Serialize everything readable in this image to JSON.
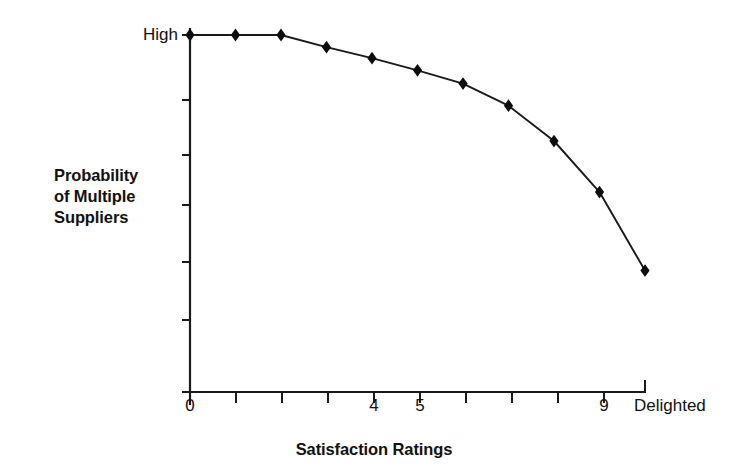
{
  "figure": {
    "background_color": "#ffffff",
    "ink_color": "#000000"
  },
  "axis": {
    "y_top_label": "High",
    "x_title": "Satisfaction Ratings",
    "y_title_line1": "Probability",
    "y_title_line2": "of Multiple",
    "y_title_line3": "Suppliers",
    "x_labels": [
      {
        "x": 0,
        "text": "0"
      },
      {
        "x": 4,
        "text": "4"
      },
      {
        "x": 5,
        "text": "5"
      },
      {
        "x": 9,
        "text": "9"
      },
      {
        "x": 10,
        "text": "Delighted"
      }
    ]
  },
  "chart_data": {
    "type": "line",
    "title": "",
    "xlabel": "Satisfaction Ratings",
    "ylabel": "Probability of Multiple Suppliers",
    "x": [
      0,
      1,
      2,
      3,
      4,
      5,
      6,
      7,
      8,
      9,
      10
    ],
    "x_tick_labels": [
      "0",
      "",
      "",
      "",
      "4",
      "5",
      "",
      "",
      "",
      "9",
      "Delighted"
    ],
    "y_tick_labels": [
      "High",
      "",
      "",
      "",
      "",
      "",
      "",
      "",
      ""
    ],
    "values": [
      1.0,
      1.0,
      1.0,
      0.966,
      0.935,
      0.901,
      0.864,
      0.802,
      0.703,
      0.56,
      0.34
    ],
    "xlim": [
      0,
      10
    ],
    "ylim": [
      0,
      1
    ],
    "grid": false,
    "legend": false,
    "marker": "diamond",
    "series": [
      {
        "name": "Probability of Multiple Suppliers",
        "values": [
          1.0,
          1.0,
          1.0,
          0.966,
          0.935,
          0.901,
          0.864,
          0.802,
          0.703,
          0.56,
          0.34
        ]
      }
    ],
    "annotations": [
      "Y axis top tick labeled High",
      "X axis rightmost tick labeled Delighted"
    ]
  }
}
